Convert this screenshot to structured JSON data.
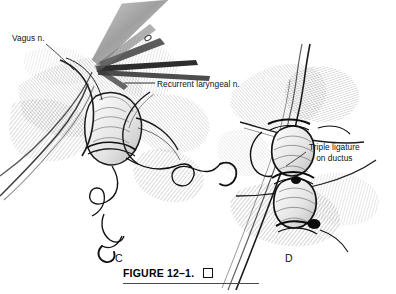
{
  "figure": {
    "caption": "FIGURE 12–1.",
    "caption_end_marker": "□",
    "panels": [
      {
        "letter": "C",
        "name": "ligation-of-ductus-with-sutures"
      },
      {
        "letter": "D",
        "name": "triple-ligature-completed"
      }
    ]
  },
  "labels": {
    "vagus": "Vagus n.",
    "recurrent": "Recurrent laryngeal n.",
    "triple_line1": "Triple ligature",
    "triple_line2": "on ductus"
  },
  "colors": {
    "ink": "#111111",
    "line": "#1a1a1a",
    "hatch": "#4a4a4a",
    "hatch_light": "#8d8d8d",
    "instrument": "#9a9a9a",
    "instrument_dark": "#5a5a5a",
    "background": "#ffffff",
    "rule": "#4a4a4a"
  }
}
